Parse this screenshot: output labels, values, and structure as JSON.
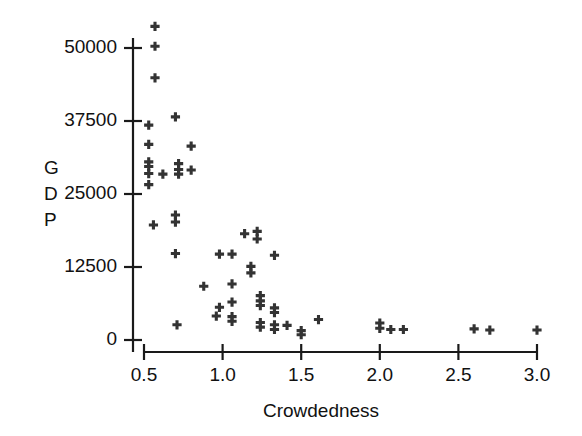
{
  "chart_data": {
    "type": "scatter",
    "title": "",
    "xlabel": "Crowdedness",
    "ylabel": "GDP",
    "ylabel_chars": [
      "G",
      "D",
      "P"
    ],
    "xlim": [
      0.45,
      3.05
    ],
    "ylim": [
      -2500,
      55500
    ],
    "xticks": [
      0.5,
      1.0,
      1.5,
      2.0,
      2.5,
      3.0
    ],
    "xtick_labels": [
      "0.5",
      "1.0",
      "1.5",
      "2.0",
      "2.5",
      "3.0"
    ],
    "yticks": [
      0,
      12500,
      25000,
      37500,
      50000
    ],
    "ytick_labels": [
      "0",
      "12500",
      "25000",
      "37500",
      "50000"
    ],
    "grid": false,
    "legend": null,
    "marker": "plus",
    "marker_color": "#333333",
    "points": [
      {
        "x": 0.57,
        "y": 53700
      },
      {
        "x": 0.57,
        "y": 50300
      },
      {
        "x": 0.57,
        "y": 44900
      },
      {
        "x": 0.7,
        "y": 38200
      },
      {
        "x": 0.53,
        "y": 36800
      },
      {
        "x": 0.53,
        "y": 33500
      },
      {
        "x": 0.8,
        "y": 33200
      },
      {
        "x": 0.53,
        "y": 30500
      },
      {
        "x": 0.53,
        "y": 29700
      },
      {
        "x": 0.72,
        "y": 30200
      },
      {
        "x": 0.72,
        "y": 29200
      },
      {
        "x": 0.8,
        "y": 29100
      },
      {
        "x": 0.53,
        "y": 28500
      },
      {
        "x": 0.62,
        "y": 28400
      },
      {
        "x": 0.72,
        "y": 28400
      },
      {
        "x": 0.53,
        "y": 26600
      },
      {
        "x": 0.7,
        "y": 21400
      },
      {
        "x": 0.7,
        "y": 20200
      },
      {
        "x": 0.56,
        "y": 19700
      },
      {
        "x": 1.14,
        "y": 18200
      },
      {
        "x": 1.22,
        "y": 18600
      },
      {
        "x": 1.22,
        "y": 17300
      },
      {
        "x": 0.7,
        "y": 14800
      },
      {
        "x": 0.98,
        "y": 14700
      },
      {
        "x": 1.06,
        "y": 14700
      },
      {
        "x": 1.33,
        "y": 14500
      },
      {
        "x": 1.18,
        "y": 12600
      },
      {
        "x": 1.18,
        "y": 11500
      },
      {
        "x": 0.88,
        "y": 9200
      },
      {
        "x": 1.06,
        "y": 9600
      },
      {
        "x": 1.24,
        "y": 7600
      },
      {
        "x": 1.24,
        "y": 6700
      },
      {
        "x": 1.24,
        "y": 5900
      },
      {
        "x": 1.06,
        "y": 6500
      },
      {
        "x": 0.98,
        "y": 5600
      },
      {
        "x": 1.33,
        "y": 5500
      },
      {
        "x": 1.33,
        "y": 4700
      },
      {
        "x": 1.06,
        "y": 4000
      },
      {
        "x": 1.06,
        "y": 3200
      },
      {
        "x": 0.96,
        "y": 4100
      },
      {
        "x": 1.24,
        "y": 3000
      },
      {
        "x": 1.24,
        "y": 2200
      },
      {
        "x": 1.33,
        "y": 2600
      },
      {
        "x": 1.33,
        "y": 1800
      },
      {
        "x": 1.41,
        "y": 2500
      },
      {
        "x": 0.71,
        "y": 2600
      },
      {
        "x": 1.5,
        "y": 1600
      },
      {
        "x": 1.5,
        "y": 900
      },
      {
        "x": 1.61,
        "y": 3500
      },
      {
        "x": 2.0,
        "y": 2900
      },
      {
        "x": 2.0,
        "y": 2000
      },
      {
        "x": 2.07,
        "y": 1800
      },
      {
        "x": 2.15,
        "y": 1800
      },
      {
        "x": 2.6,
        "y": 1900
      },
      {
        "x": 2.7,
        "y": 1700
      },
      {
        "x": 3.0,
        "y": 1700
      }
    ]
  },
  "axis": {
    "x_axis_name": "x-axis",
    "y_axis_name": "y-axis"
  }
}
